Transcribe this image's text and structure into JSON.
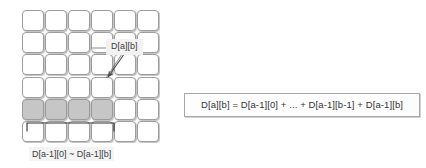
{
  "diagram": {
    "type": "dp-table-recurrence-diagram",
    "grid": {
      "rows": 6,
      "cols": 6,
      "shaded_row_index": 4,
      "shaded_col_indices": [
        0,
        1,
        2,
        3
      ],
      "cell_fill_default": "#ffffff",
      "cell_fill_shaded": "#c6c6c6",
      "cell_border_color": "#9d9d9d"
    },
    "callout": {
      "label": "D[a][b]",
      "arrow": {
        "from_x": 126,
        "from_y": 52,
        "to_x": 108,
        "to_y": 79
      }
    },
    "bracket": {
      "caption": "D[a-1][0] ~ D[a-1][b]",
      "spans_columns": 4
    },
    "formula": {
      "text": "D[a][b] = D[a-1][0] + ... + D[a-1][b-1] + D[a-1][b]",
      "border_color": "#a8a8a8",
      "background": "#fdfdfd"
    }
  }
}
